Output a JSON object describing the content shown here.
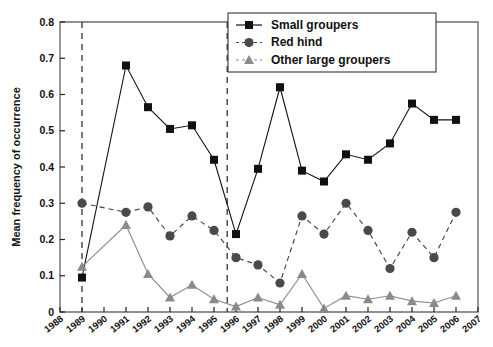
{
  "chart_data": {
    "type": "line",
    "title": "",
    "xlabel": "",
    "ylabel": "Mean frequency of occurrence",
    "xlim": [
      1988,
      2007
    ],
    "ylim": [
      0,
      0.8
    ],
    "grid": false,
    "legend_position": "top-right",
    "x_tick_labels": [
      "1988",
      "1989",
      "1990",
      "1991",
      "1992",
      "1993",
      "1994",
      "1995",
      "1996",
      "1997",
      "1998",
      "1999",
      "2000",
      "2001",
      "2002",
      "2003",
      "2004",
      "2005",
      "2006",
      "2007"
    ],
    "y_tick_labels": [
      "0",
      "0.1",
      "0.2",
      "0.3",
      "0.4",
      "0.5",
      "0.6",
      "0.7",
      "0.8"
    ],
    "y_tick_values": [
      0,
      0.1,
      0.2,
      0.3,
      0.4,
      0.5,
      0.6,
      0.7,
      0.8
    ],
    "annotations": [
      {
        "type": "vline",
        "x": 1989.0,
        "style": "dashed",
        "label": ""
      },
      {
        "type": "vline",
        "x": 1995.6,
        "style": "dashed",
        "label": ""
      }
    ],
    "series": [
      {
        "name": "Small groupers",
        "marker": "square",
        "color": "#111111",
        "linestyle": "solid",
        "x": [
          1989,
          1991,
          1992,
          1993,
          1994,
          1995,
          1996,
          1997,
          1998,
          1999,
          2000,
          2001,
          2002,
          2003,
          2004,
          2005,
          2006
        ],
        "values": [
          0.095,
          0.68,
          0.565,
          0.505,
          0.515,
          0.42,
          0.215,
          0.395,
          0.62,
          0.39,
          0.36,
          0.435,
          0.42,
          0.465,
          0.575,
          0.53,
          0.53
        ]
      },
      {
        "name": "Red hind",
        "marker": "circle",
        "color": "#4a4a4a",
        "linestyle": "dashed",
        "x": [
          1989,
          1991,
          1992,
          1993,
          1994,
          1995,
          1996,
          1997,
          1998,
          1999,
          2000,
          2001,
          2002,
          2003,
          2004,
          2005,
          2006
        ],
        "values": [
          0.3,
          0.275,
          0.29,
          0.21,
          0.265,
          0.225,
          0.15,
          0.13,
          0.08,
          0.265,
          0.215,
          0.3,
          0.225,
          0.12,
          0.22,
          0.15,
          0.275
        ]
      },
      {
        "name": "Other large groupers",
        "marker": "triangle",
        "color": "#8a8a8a",
        "linestyle": "dashed",
        "x": [
          1989,
          1991,
          1992,
          1993,
          1994,
          1995,
          1996,
          1997,
          1998,
          1999,
          2000,
          2001,
          2002,
          2003,
          2004,
          2005,
          2006
        ],
        "values": [
          0.125,
          0.24,
          0.105,
          0.04,
          0.075,
          0.035,
          0.015,
          0.04,
          0.02,
          0.105,
          0.01,
          0.045,
          0.035,
          0.045,
          0.03,
          0.025,
          0.045
        ]
      }
    ]
  },
  "legend": {
    "items": [
      {
        "label": "Small groupers"
      },
      {
        "label": "Red hind"
      },
      {
        "label": "Other large groupers"
      }
    ]
  }
}
